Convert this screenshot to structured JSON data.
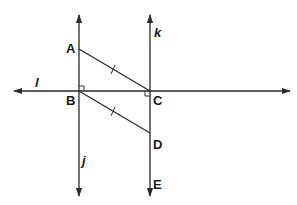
{
  "diagram": {
    "lines": [
      {
        "name": "l",
        "label": "l",
        "orientation": "horizontal",
        "from": [
          14,
          91
        ],
        "to": [
          290,
          91
        ]
      },
      {
        "name": "j",
        "label": "j",
        "orientation": "vertical",
        "from": [
          79,
          15
        ],
        "to": [
          79,
          195
        ]
      },
      {
        "name": "k",
        "label": "k",
        "orientation": "vertical",
        "from": [
          150,
          15
        ],
        "to": [
          150,
          195
        ]
      }
    ],
    "points": {
      "A": {
        "label": "A",
        "x": 79,
        "y": 49
      },
      "B": {
        "label": "B",
        "x": 79,
        "y": 91
      },
      "C": {
        "label": "C",
        "x": 150,
        "y": 91
      },
      "D": {
        "label": "D",
        "x": 150,
        "y": 133
      },
      "E": {
        "label": "E",
        "x": 150,
        "y": 183
      }
    },
    "segments": [
      {
        "name": "AC",
        "from": "A",
        "to": "C",
        "tick_marks": 1
      },
      {
        "name": "BD",
        "from": "B",
        "to": "D",
        "tick_marks": 1
      }
    ],
    "right_angles": [
      "B",
      "C"
    ],
    "labels": {
      "A": "A",
      "B": "B",
      "C": "C",
      "D": "D",
      "E": "E",
      "l": "l",
      "j": "j",
      "k": "k"
    },
    "colors": {
      "stroke": "#2a2a2a",
      "background": "#ffffff"
    }
  }
}
